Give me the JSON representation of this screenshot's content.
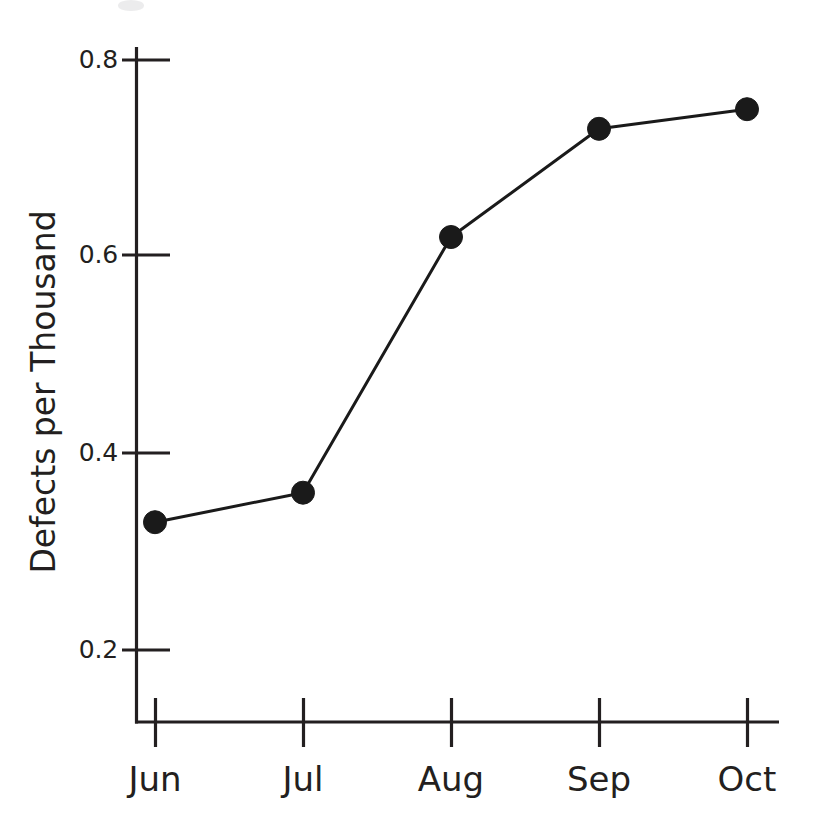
{
  "figure": {
    "background_color": "#ffffff",
    "ink_color": "#231f20",
    "marker_color": "#1a1a1a"
  },
  "chart_data": {
    "type": "line",
    "title": "",
    "subtitle": "",
    "xlabel": "",
    "ylabel": "Defects per Thousand",
    "categories": [
      "Jun",
      "Jul",
      "Aug",
      "Sep",
      "Oct"
    ],
    "values": [
      0.33,
      0.36,
      0.62,
      0.73,
      0.75
    ],
    "series": [
      {
        "name": "Defects per Thousand",
        "values": [
          0.33,
          0.36,
          0.62,
          0.73,
          0.75
        ]
      }
    ],
    "ylim": [
      0.13,
      0.8
    ],
    "yticks": [
      0.2,
      0.4,
      0.6,
      0.8
    ],
    "ytick_labels": [
      "0.2",
      "0.4",
      "0.6",
      "0.8"
    ],
    "xtick_labels": [
      "Jun",
      "Jul",
      "Aug",
      "Sep",
      "Oct"
    ],
    "grid": false,
    "legend": false,
    "legend_position": "none",
    "marker": "filled-circle",
    "annotations": []
  },
  "axes": {
    "y_title": "Defects per Thousand",
    "y_tick_0": "0.2",
    "y_tick_1": "0.4",
    "y_tick_2": "0.6",
    "y_tick_3": "0.8",
    "x_tick_0": "Jun",
    "x_tick_1": "Jul",
    "x_tick_2": "Aug",
    "x_tick_3": "Sep",
    "x_tick_4": "Oct"
  }
}
